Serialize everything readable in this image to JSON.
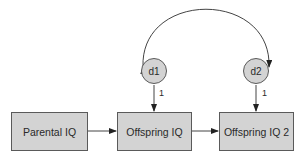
{
  "diagram": {
    "type": "path-diagram",
    "colors": {
      "node_fill": "#d3d3d3",
      "stroke": "#5a5a5a",
      "text": "#2a2a2a",
      "background": "#ffffff"
    },
    "nodes": {
      "parental_iq": {
        "label": "Parental IQ",
        "shape": "rectangle"
      },
      "offspring_iq": {
        "label": "Offspring IQ",
        "shape": "rectangle"
      },
      "offspring_iq_2": {
        "label": "Offspring IQ 2",
        "shape": "rectangle"
      },
      "d1": {
        "label": "d1",
        "shape": "circle"
      },
      "d2": {
        "label": "d2",
        "shape": "circle"
      }
    },
    "edges": [
      {
        "from": "Parental IQ",
        "to": "Offspring IQ",
        "type": "directed"
      },
      {
        "from": "Offspring IQ",
        "to": "Offspring IQ 2",
        "type": "directed"
      },
      {
        "from": "d1",
        "to": "Offspring IQ",
        "type": "directed",
        "label": "1"
      },
      {
        "from": "d2",
        "to": "Offspring IQ 2",
        "type": "directed",
        "label": "1"
      },
      {
        "from": "d1",
        "to": "d2",
        "type": "bidirectional-covariance"
      }
    ],
    "edge_labels": {
      "d1_path": "1",
      "d2_path": "1"
    }
  }
}
